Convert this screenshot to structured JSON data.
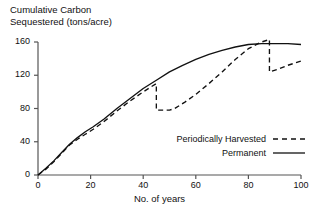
{
  "chart_data": {
    "type": "line",
    "title": "",
    "ylabel": "Cumulative Carbon\nSequestered (tons/acre)",
    "xlabel": "No. of years",
    "xlim": [
      0,
      100
    ],
    "ylim": [
      0,
      160
    ],
    "grid": false,
    "xticks": [
      0,
      20,
      40,
      60,
      80,
      100
    ],
    "yticks": [
      0,
      40,
      80,
      120,
      160
    ],
    "xtick_labels": [
      "0",
      "20",
      "40",
      "60",
      "80",
      "100"
    ],
    "ytick_labels": [
      "0",
      "40",
      "80",
      "120",
      "160"
    ],
    "legend_position": "lower-right",
    "series": [
      {
        "name": "Permanent",
        "style": "solid",
        "color": "#111111",
        "x": [
          0,
          3,
          6,
          9,
          12,
          15,
          18,
          21,
          25,
          30,
          35,
          40,
          45,
          50,
          55,
          60,
          65,
          70,
          75,
          80,
          85,
          90,
          95,
          100
        ],
        "y": [
          0,
          8,
          17,
          27,
          37,
          45,
          52,
          58,
          67,
          80,
          92,
          104,
          114,
          124,
          132,
          139,
          145,
          150,
          154,
          157,
          158,
          158,
          158,
          157
        ]
      },
      {
        "name": "Periodically Harvested",
        "style": "dashed",
        "color": "#111111",
        "x": [
          0,
          3,
          6,
          9,
          12,
          15,
          18,
          21,
          25,
          30,
          35,
          40,
          45,
          45,
          50,
          52,
          56,
          60,
          65,
          70,
          75,
          80,
          85,
          88,
          88,
          91,
          95,
          100
        ],
        "y": [
          0,
          7,
          16,
          26,
          36,
          43,
          49,
          55,
          64,
          77,
          89,
          100,
          110,
          78,
          78,
          80,
          88,
          97,
          110,
          124,
          139,
          152,
          160,
          163,
          124,
          127,
          132,
          137
        ]
      }
    ],
    "harvest_events": [
      {
        "year": 45,
        "from": 110,
        "to": 78
      },
      {
        "year": 88,
        "from": 163,
        "to": 124
      }
    ]
  },
  "legend": {
    "entries": [
      {
        "label": "Periodically Harvested",
        "style": "dashed"
      },
      {
        "label": "Permanent",
        "style": "solid"
      }
    ]
  }
}
